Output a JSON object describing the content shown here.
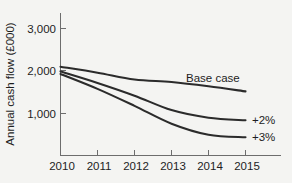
{
  "chart_data": {
    "type": "line",
    "title": "",
    "xlabel": "",
    "ylabel": "Annual cash flow (£000)",
    "x": [
      2010,
      2011,
      2012,
      2013,
      2014,
      2015
    ],
    "xticklabels": [
      "2010",
      "2011",
      "2012",
      "2013",
      "2014",
      "2015"
    ],
    "yticks": [
      1000,
      2000,
      3000
    ],
    "yticklabels": [
      "1,000",
      "2,000",
      "3,000"
    ],
    "xlim": [
      2010,
      2015.95
    ],
    "ylim": [
      0,
      3250
    ],
    "grid": false,
    "legend_position": "inline-right",
    "series": [
      {
        "name": "Base case",
        "label": "Base case",
        "values": [
          2100,
          1960,
          1800,
          1740,
          1640,
          1520
        ]
      },
      {
        "name": "+2%",
        "label": "+2%",
        "values": [
          1990,
          1720,
          1420,
          1080,
          900,
          840
        ]
      },
      {
        "name": "+3%",
        "label": "+3%",
        "values": [
          1930,
          1580,
          1180,
          760,
          500,
          440
        ]
      }
    ],
    "annotations": [
      {
        "text": "Base case",
        "x": 2014.0,
        "y": 1930
      },
      {
        "text": "+2%",
        "x": 2016.1,
        "y": 860
      },
      {
        "text": "+3%",
        "x": 2016.1,
        "y": 450
      }
    ],
    "colors": {
      "background": "#f4f4f2",
      "line": "#2b2b2b",
      "axis": "#6d6d6d",
      "text": "#1d1d1d"
    }
  }
}
